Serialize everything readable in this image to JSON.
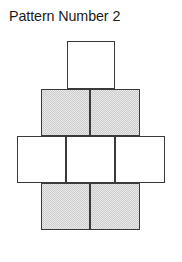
{
  "title": "Pattern Number 2",
  "figure": {
    "name": "pattern-number-2-tessellation",
    "background_color": "#ffffff",
    "stroke_color": "#3a3a3a",
    "shaded_color": "#cdcdcd",
    "white_color": "#ffffff",
    "cell_width": 48,
    "cell_height": 47,
    "rows": [
      {
        "index": 1,
        "fill": "white",
        "count": 1,
        "top": 41,
        "cells": [
          {
            "name": "cell-r1-c1",
            "fill": "white",
            "left": 67,
            "top": 41,
            "width": 48,
            "height": 48
          }
        ]
      },
      {
        "index": 2,
        "fill": "shaded",
        "count": 2,
        "top": 89,
        "cells": [
          {
            "name": "cell-r2-c1",
            "fill": "shaded",
            "left": 41,
            "top": 89,
            "width": 49,
            "height": 47
          },
          {
            "name": "cell-r2-c2",
            "fill": "shaded",
            "left": 90,
            "top": 89,
            "width": 50,
            "height": 47
          }
        ]
      },
      {
        "index": 3,
        "fill": "white",
        "count": 3,
        "top": 136,
        "cells": [
          {
            "name": "cell-r3-c1",
            "fill": "white",
            "left": 17,
            "top": 136,
            "width": 49,
            "height": 47
          },
          {
            "name": "cell-r3-c2",
            "fill": "white",
            "left": 66,
            "top": 136,
            "width": 49,
            "height": 47
          },
          {
            "name": "cell-r3-c3",
            "fill": "white",
            "left": 115,
            "top": 136,
            "width": 50,
            "height": 47
          }
        ]
      },
      {
        "index": 4,
        "fill": "shaded",
        "count": 2,
        "top": 183,
        "cells": [
          {
            "name": "cell-r4-c1",
            "fill": "shaded",
            "left": 41,
            "top": 183,
            "width": 49,
            "height": 47
          },
          {
            "name": "cell-r4-c2",
            "fill": "shaded",
            "left": 90,
            "top": 183,
            "width": 50,
            "height": 47
          }
        ]
      }
    ]
  }
}
